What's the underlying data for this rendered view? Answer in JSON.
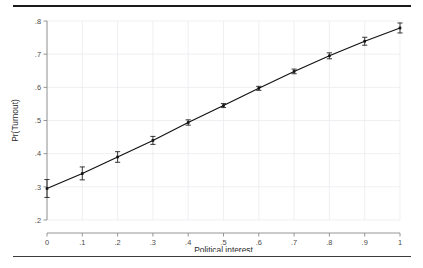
{
  "figure": {
    "background_color": "#ffffff",
    "rule_top_color": "#1a1a1a",
    "rule_bottom_color": "#3a3a3a"
  },
  "chart_data": {
    "type": "line",
    "title": "",
    "subtitle": "",
    "xlabel": "Political interest",
    "ylabel": "Pr(Turnout)",
    "xlim": [
      0,
      1
    ],
    "ylim": [
      0.2,
      0.8
    ],
    "grid": true,
    "legend": "none",
    "marker": "square",
    "error_bars": "95% confidence interval",
    "line_color": "#111111",
    "marker_color": "#111111",
    "error_color": "#222222",
    "grid_color": "#e9e9ef",
    "axis_color": "#8a8a8a",
    "x": [
      0,
      0.1,
      0.2,
      0.3,
      0.4,
      0.5,
      0.6,
      0.7,
      0.8,
      0.9,
      1
    ],
    "xtick_labels": [
      "0",
      ".1",
      ".2",
      ".3",
      ".4",
      ".5",
      ".6",
      ".7",
      ".8",
      ".9",
      "1"
    ],
    "ytick_values": [
      0.2,
      0.3,
      0.4,
      0.5,
      0.6,
      0.7,
      0.8
    ],
    "ytick_labels": [
      ".2",
      ".3",
      ".4",
      ".5",
      ".6",
      ".7",
      ".8"
    ],
    "values": [
      0.295,
      0.34,
      0.39,
      0.44,
      0.494,
      0.545,
      0.597,
      0.648,
      0.695,
      0.739,
      0.779
    ],
    "err_low": [
      0.268,
      0.321,
      0.374,
      0.428,
      0.486,
      0.539,
      0.591,
      0.641,
      0.686,
      0.727,
      0.764
    ],
    "err_high": [
      0.322,
      0.36,
      0.406,
      0.452,
      0.502,
      0.551,
      0.603,
      0.655,
      0.704,
      0.751,
      0.794
    ]
  }
}
